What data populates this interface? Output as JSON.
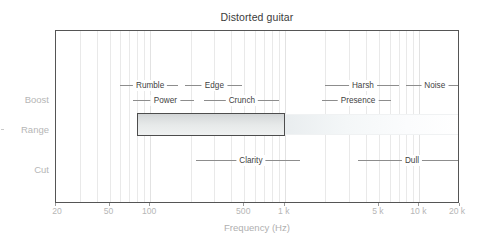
{
  "chart_data": {
    "type": "bar",
    "title": "Distorted guitar",
    "xlabel": "Frequency (Hz)",
    "ylabel": "",
    "xscale": "log",
    "xlim": [
      20,
      20000
    ],
    "grid": true,
    "legend": "none",
    "xticks": [
      {
        "label": "20",
        "value": 20
      },
      {
        "label": "50",
        "value": 50
      },
      {
        "label": "100",
        "value": 100
      },
      {
        "label": "500",
        "value": 500
      },
      {
        "label": "1 k",
        "value": 1000
      },
      {
        "label": "5 k",
        "value": 5000
      },
      {
        "label": "10 k",
        "value": 10000
      },
      {
        "label": "20 k",
        "value": 20000
      }
    ],
    "yticks": [
      {
        "label": "Boost",
        "value": 1
      },
      {
        "label": "Range",
        "value": 0
      },
      {
        "label": "Cut",
        "value": -1
      }
    ],
    "series": [
      {
        "name": "Distorted guitar range",
        "row": "Range",
        "start_hz": 80,
        "end_hz": 1000,
        "tail_end_hz": 20000
      }
    ],
    "annotations": {
      "boost_row_1": [
        {
          "label": "Rumble",
          "start_hz": 60,
          "end_hz": 160,
          "center_hz": 100
        },
        {
          "label": "Edge",
          "start_hz": 180,
          "end_hz": 480,
          "center_hz": 300
        },
        {
          "label": "Harsh",
          "start_hz": 2000,
          "end_hz": 7000,
          "center_hz": 3800
        },
        {
          "label": "Noise",
          "start_hz": 8000,
          "end_hz": 20000,
          "center_hz": 13000
        }
      ],
      "boost_row_2": [
        {
          "label": "Power",
          "start_hz": 75,
          "end_hz": 210,
          "center_hz": 130
        },
        {
          "label": "Crunch",
          "start_hz": 250,
          "end_hz": 900,
          "center_hz": 480
        },
        {
          "label": "Presence",
          "start_hz": 1900,
          "end_hz": 6200,
          "center_hz": 3500
        }
      ],
      "cut_row": [
        {
          "label": "Clarity",
          "start_hz": 220,
          "end_hz": 1300,
          "center_hz": 560
        },
        {
          "label": "Dull",
          "start_hz": 3500,
          "end_hz": 20000,
          "center_hz": 8800
        }
      ]
    },
    "gridline_values": [
      30,
      40,
      50,
      60,
      70,
      80,
      90,
      100,
      200,
      300,
      400,
      500,
      600,
      700,
      800,
      900,
      1000,
      2000,
      3000,
      4000,
      5000,
      6000,
      7000,
      8000,
      9000,
      10000
    ],
    "colors": {
      "bar_border": "#4d4d4d",
      "bar_fill_top": "#d2d5d6",
      "bar_fill_bottom": "#eff1f1",
      "grid": "#e9e9e9",
      "axis_text": "#b6b6b6",
      "title_text": "#3b3b3b",
      "annotation_text": "#3f3f3f",
      "annotation_rule": "#8d8d8d",
      "frame": "#555555",
      "background": "#ffffff"
    }
  }
}
